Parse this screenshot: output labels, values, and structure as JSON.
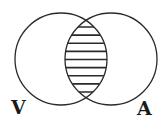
{
  "diagram": {
    "type": "venn",
    "sets": [
      {
        "label": "V",
        "cx": 61,
        "cy": 59,
        "r": 46
      },
      {
        "label": "A",
        "cx": 111,
        "cy": 59,
        "r": 46
      }
    ],
    "intersection": {
      "fill": "horizontal-hatch",
      "hatch_line_count": 9
    },
    "colors": {
      "stroke": "#2a2a2a",
      "background": "#ffffff"
    }
  }
}
